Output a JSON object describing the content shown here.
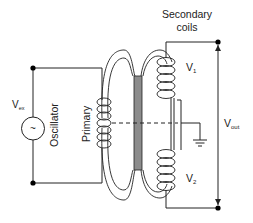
{
  "diagram": {
    "labels": {
      "secondary_line1": "Secondary",
      "secondary_line2": "coils",
      "v1_main": "V",
      "v1_sub": "1",
      "v2_main": "V",
      "v2_sub": "2",
      "vex_main": "V",
      "vex_sub": "ex",
      "vout_main": "V",
      "vout_sub": "out",
      "oscillator": "Oscillator",
      "primary": "Primary",
      "source_symbol": "~"
    },
    "colors": {
      "line": "#222222",
      "core": "#8c8c8c",
      "background": "#ffffff"
    }
  }
}
